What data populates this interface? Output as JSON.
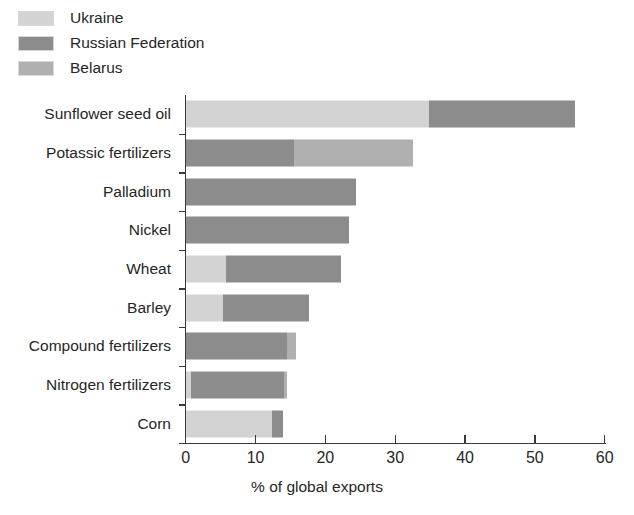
{
  "legend": {
    "items": [
      {
        "label": "Ukraine",
        "color": "#d3d3d3"
      },
      {
        "label": "Russian Federation",
        "color": "#8c8c8c"
      },
      {
        "label": "Belarus",
        "color": "#b0b0b0"
      }
    ]
  },
  "axis": {
    "x_title": "% of global exports",
    "x_ticks": [
      "0",
      "10",
      "20",
      "30",
      "40",
      "50",
      "60"
    ]
  },
  "chart_data": {
    "type": "bar",
    "orientation": "horizontal",
    "stacked": true,
    "title": "",
    "xlabel": "% of global exports",
    "ylabel": "",
    "xlim": [
      0,
      60
    ],
    "xticks": [
      0,
      10,
      20,
      30,
      40,
      50,
      60
    ],
    "grid": false,
    "legend_position": "top-left",
    "categories": [
      "Sunflower seed oil",
      "Potassic fertilizers",
      "Palladium",
      "Nickel",
      "Wheat",
      "Barley",
      "Compound fertilizers",
      "Nitrogen fertilizers",
      "Corn"
    ],
    "series": [
      {
        "name": "Ukraine",
        "color": "#d3d3d3",
        "values": [
          34.8,
          0,
          0,
          0,
          5.7,
          5.3,
          0,
          0.7,
          12.3
        ]
      },
      {
        "name": "Russian Federation",
        "color": "#8c8c8c",
        "values": [
          20.9,
          15.5,
          24.4,
          23.4,
          16.5,
          12.3,
          14.5,
          13.4,
          1.6
        ]
      },
      {
        "name": "Belarus",
        "color": "#b0b0b0",
        "values": [
          0,
          17.0,
          0,
          0,
          0,
          0,
          1.3,
          0.4,
          0
        ]
      }
    ],
    "totals": [
      55.7,
      32.5,
      24.4,
      23.4,
      22.2,
      17.6,
      15.8,
      14.5,
      13.9
    ]
  }
}
